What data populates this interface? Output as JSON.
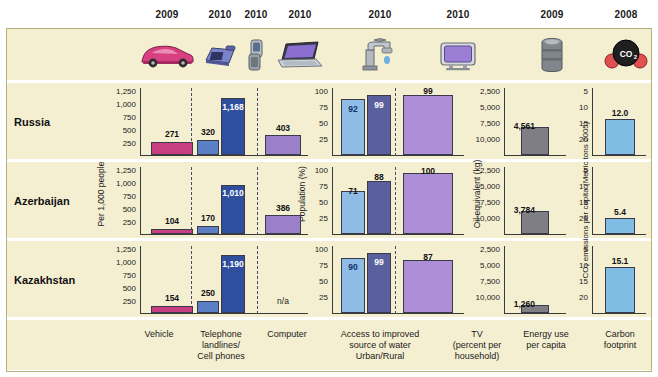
{
  "header": {
    "years": [
      "2009",
      "2010",
      "2010",
      "2010",
      "2010",
      "2010",
      "2009",
      "2008"
    ],
    "icons": [
      "car-icon",
      "telephone-landline-icon",
      "cell-phone-icon",
      "laptop-icon",
      "faucet-icon",
      "television-icon",
      "oil-barrel-icon",
      "co2-molecule-icon"
    ]
  },
  "rows": {
    "labels": [
      "Russia",
      "Azerbaijan",
      "Kazakhstan"
    ]
  },
  "axes": {
    "left_title": "Per 1,000 people",
    "left_ticks": [
      "1,250",
      "1,000",
      "750",
      "500",
      "250"
    ],
    "mid_title": "Population (%)",
    "mid_ticks": [
      "100",
      "75",
      "50",
      "25"
    ],
    "energy_title": "Oil equivalent (kg)",
    "energy_ticks": [
      "10,000",
      "7,500",
      "5,000",
      "2,500"
    ],
    "co2_title": "CO₂ emissions per capita (Metric tons 2005)",
    "co2_ticks": [
      "20",
      "15",
      "10",
      "5"
    ]
  },
  "footer": {
    "categories": [
      "Vehicle",
      "Telephone\nlandlines/\nCell phones",
      "Computer",
      "Access to improved\nsource of water\nUrban/Rural",
      "TV\n(percent per\nhousehold)",
      "Energy use\nper capita",
      "Carbon\nfootprint"
    ]
  },
  "colors": {
    "background_band": "#f5efd2",
    "vehicle": "#c83f80",
    "landline": "#5b7fc4",
    "cellphone": "#2f4f9e",
    "computer": "#9b7fc9",
    "water_urban": "#8fbce4",
    "water_rural": "#5a5f9e",
    "tv": "#ac8fd6",
    "energy": "#7e7e84",
    "carbon": "#7fbde4"
  },
  "chart_data": {
    "type": "bar",
    "countries": [
      "Russia",
      "Azerbaijan",
      "Kazakhstan"
    ],
    "panels": [
      {
        "name": "per-1000-people",
        "ylabel": "Per 1,000 people",
        "ylim": [
          0,
          1400
        ],
        "yticks": [
          250,
          500,
          750,
          1000,
          1250
        ],
        "series": [
          {
            "name": "Vehicle",
            "year": "2009",
            "color": "#c83f80",
            "values": [
              271,
              104,
              154
            ],
            "labels": [
              "271",
              "104",
              "154"
            ]
          },
          {
            "name": "Telephone landlines",
            "year": "2010",
            "color": "#5b7fc4",
            "values": [
              320,
              170,
              250
            ],
            "labels": [
              "320",
              "170",
              "250"
            ]
          },
          {
            "name": "Cell phones",
            "year": "2010",
            "color": "#2f4f9e",
            "values": [
              1168,
              1010,
              1190
            ],
            "labels": [
              "1,168",
              "1,010",
              "1,190"
            ]
          },
          {
            "name": "Computer",
            "year": "2010",
            "color": "#9b7fc9",
            "values": [
              403,
              386,
              null
            ],
            "labels": [
              "403",
              "386",
              "n/a"
            ]
          }
        ]
      },
      {
        "name": "population-percent",
        "ylabel": "Population (%)",
        "ylim": [
          0,
          112
        ],
        "yticks": [
          25,
          50,
          75,
          100
        ],
        "series": [
          {
            "name": "Access to improved source of water - Urban",
            "year": "2010",
            "color": "#8fbce4",
            "values": [
              92,
              71,
              90
            ],
            "labels": [
              "92",
              "71",
              "90"
            ]
          },
          {
            "name": "Access to improved source of water - Rural",
            "year": "2010",
            "color": "#5a5f9e",
            "values": [
              99,
              88,
              99
            ],
            "labels": [
              "99",
              "88",
              "99"
            ]
          },
          {
            "name": "TV (percent per household)",
            "year": "2010",
            "color": "#ac8fd6",
            "values": [
              99,
              100,
              87
            ],
            "labels": [
              "99",
              "100",
              "87"
            ]
          }
        ]
      },
      {
        "name": "energy-use-per-capita",
        "ylabel": "Oil equivalent (kg)",
        "ylim": [
          0,
          11200
        ],
        "yticks": [
          2500,
          5000,
          7500,
          10000
        ],
        "series": [
          {
            "name": "Energy use per capita",
            "year": "2009",
            "color": "#7e7e84",
            "values": [
              4561,
              3784,
              1260
            ],
            "labels": [
              "4,561",
              "3,784",
              "1,260"
            ]
          }
        ]
      },
      {
        "name": "carbon-footprint",
        "ylabel": "CO₂ emissions per capita (Metric tons 2005)",
        "ylim": [
          0,
          22.4
        ],
        "yticks": [
          5,
          10,
          15,
          20
        ],
        "series": [
          {
            "name": "Carbon footprint",
            "year": "2008",
            "color": "#7fbde4",
            "values": [
              12.0,
              5.4,
              15.1
            ],
            "labels": [
              "12.0",
              "5.4",
              "15.1"
            ]
          }
        ]
      }
    ]
  }
}
